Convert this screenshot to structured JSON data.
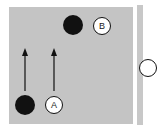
{
  "diagram": {
    "panel_color": "#c4c4c4",
    "labels": {
      "a": "A",
      "b": "B"
    },
    "elements": [
      {
        "id": "dot-a",
        "kind": "filled-dot",
        "near_label": "A"
      },
      {
        "id": "circle-a",
        "kind": "labeled-circle",
        "label": "A"
      },
      {
        "id": "dot-b",
        "kind": "filled-dot",
        "near_label": "B"
      },
      {
        "id": "circle-b",
        "kind": "labeled-circle",
        "label": "B"
      },
      {
        "id": "arrow-left",
        "kind": "arrow",
        "direction": "up"
      },
      {
        "id": "arrow-right",
        "kind": "arrow",
        "direction": "up"
      },
      {
        "id": "side-circle",
        "kind": "open-circle"
      }
    ]
  }
}
